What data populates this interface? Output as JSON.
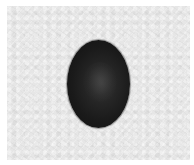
{
  "scene": {
    "description": "Dark oval seed/bean photographed on a textured light gray paper background with thin white margins",
    "subject": "bean",
    "colors": {
      "margin": "#ffffff",
      "paper": "#e6e6e6",
      "bean": "#1a1a1a",
      "bean_highlight": "#3a3a3a"
    }
  }
}
